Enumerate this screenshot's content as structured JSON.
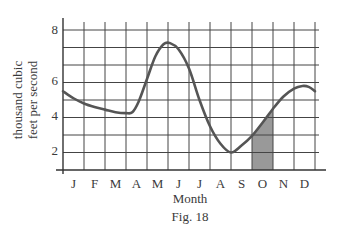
{
  "chart_data": {
    "type": "line",
    "title": "",
    "caption": "Fig. 18",
    "xlabel": "Month",
    "ylabel": "thousand cubic feet per second",
    "ylabel_lines": [
      "thousand cubic",
      "feet per second"
    ],
    "categories": [
      "J",
      "F",
      "M",
      "A",
      "M",
      "J",
      "J",
      "A",
      "S",
      "O",
      "N",
      "D"
    ],
    "yticks": [
      "2",
      "4",
      "6",
      "8"
    ],
    "ylim": [
      0,
      8.2
    ],
    "grid": true,
    "series": [
      {
        "name": "flow",
        "values": [
          3.9,
          3.5,
          3.3,
          3.3,
          5.8,
          7.2,
          5.0,
          2.0,
          1.1,
          2.7,
          4.3,
          4.7
        ]
      }
    ],
    "curve_points": [
      {
        "x": 0.0,
        "y": 4.5
      },
      {
        "x": 0.5,
        "y": 4.1
      },
      {
        "x": 1.0,
        "y": 3.8
      },
      {
        "x": 1.5,
        "y": 3.6
      },
      {
        "x": 2.0,
        "y": 3.45
      },
      {
        "x": 2.5,
        "y": 3.3
      },
      {
        "x": 3.0,
        "y": 3.25
      },
      {
        "x": 3.3,
        "y": 3.3
      },
      {
        "x": 3.6,
        "y": 3.9
      },
      {
        "x": 4.0,
        "y": 5.2
      },
      {
        "x": 4.4,
        "y": 6.5
      },
      {
        "x": 4.8,
        "y": 7.2
      },
      {
        "x": 5.1,
        "y": 7.25
      },
      {
        "x": 5.5,
        "y": 6.9
      },
      {
        "x": 6.0,
        "y": 5.8
      },
      {
        "x": 6.5,
        "y": 4.0
      },
      {
        "x": 7.0,
        "y": 2.5
      },
      {
        "x": 7.5,
        "y": 1.5
      },
      {
        "x": 8.0,
        "y": 1.0
      },
      {
        "x": 8.5,
        "y": 1.4
      },
      {
        "x": 9.0,
        "y": 1.95
      },
      {
        "x": 9.5,
        "y": 2.7
      },
      {
        "x": 10.0,
        "y": 3.5
      },
      {
        "x": 10.5,
        "y": 4.2
      },
      {
        "x": 11.0,
        "y": 4.65
      },
      {
        "x": 11.4,
        "y": 4.8
      },
      {
        "x": 11.7,
        "y": 4.75
      },
      {
        "x": 12.0,
        "y": 4.5
      }
    ],
    "shaded_region": {
      "label": "O",
      "x_start": 9,
      "x_end": 10
    },
    "colors": {
      "line": "#555555",
      "grid": "#444444",
      "shade": "#999999",
      "text": "#3a3a3a"
    }
  }
}
